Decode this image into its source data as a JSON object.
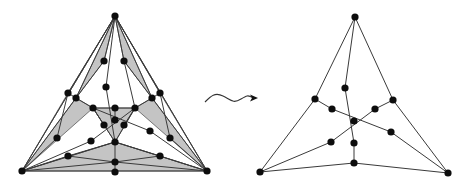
{
  "diagram": {
    "type": "graph-transformation",
    "colors": {
      "face_fill": "#c4c4c4",
      "edge": "#3a3a3a",
      "vertex": "#0d0d0d",
      "background": "#ffffff"
    },
    "left_graph": {
      "vertices": [
        [
          115,
          16
        ],
        [
          22,
          171
        ],
        [
          207,
          171
        ],
        [
          104,
          61
        ],
        [
          124,
          61
        ],
        [
          68,
          93
        ],
        [
          76,
          98
        ],
        [
          160,
          93
        ],
        [
          152,
          98
        ],
        [
          106,
          87
        ],
        [
          93,
          108
        ],
        [
          115,
          108
        ],
        [
          135,
          108
        ],
        [
          115,
          120
        ],
        [
          104,
          125
        ],
        [
          124,
          125
        ],
        [
          57,
          138
        ],
        [
          170,
          138
        ],
        [
          91,
          141
        ],
        [
          150,
          131
        ],
        [
          115,
          142
        ],
        [
          68,
          156
        ],
        [
          160,
          156
        ],
        [
          115,
          162
        ],
        [
          115,
          172
        ]
      ],
      "faces": [
        [
          [
            115,
            16
          ],
          [
            22,
            171
          ],
          [
            68,
            93
          ]
        ],
        [
          [
            115,
            16
          ],
          [
            76,
            98
          ],
          [
            104,
            61
          ]
        ],
        [
          [
            76,
            98
          ],
          [
            22,
            171
          ],
          [
            93,
            108
          ]
        ],
        [
          [
            115,
            16
          ],
          [
            207,
            171
          ],
          [
            160,
            93
          ]
        ],
        [
          [
            115,
            16
          ],
          [
            152,
            98
          ],
          [
            124,
            61
          ]
        ],
        [
          [
            152,
            98
          ],
          [
            207,
            171
          ],
          [
            135,
            108
          ]
        ],
        [
          [
            93,
            108
          ],
          [
            135,
            108
          ],
          [
            115,
            142
          ]
        ],
        [
          [
            22,
            171
          ],
          [
            207,
            171
          ],
          [
            115,
            142
          ]
        ]
      ],
      "edges": [
        [
          [
            115,
            16
          ],
          [
            22,
            171
          ]
        ],
        [
          [
            115,
            16
          ],
          [
            207,
            171
          ]
        ],
        [
          [
            22,
            171
          ],
          [
            207,
            171
          ]
        ],
        [
          [
            115,
            16
          ],
          [
            68,
            93
          ]
        ],
        [
          [
            115,
            16
          ],
          [
            76,
            98
          ]
        ],
        [
          [
            115,
            16
          ],
          [
            104,
            61
          ]
        ],
        [
          [
            115,
            16
          ],
          [
            160,
            93
          ]
        ],
        [
          [
            115,
            16
          ],
          [
            152,
            98
          ]
        ],
        [
          [
            115,
            16
          ],
          [
            124,
            61
          ]
        ],
        [
          [
            115,
            16
          ],
          [
            106,
            87
          ]
        ],
        [
          [
            106,
            87
          ],
          [
            115,
            142
          ]
        ],
        [
          [
            104,
            61
          ],
          [
            76,
            98
          ]
        ],
        [
          [
            124,
            61
          ],
          [
            152,
            98
          ]
        ],
        [
          [
            68,
            93
          ],
          [
            76,
            98
          ]
        ],
        [
          [
            160,
            93
          ],
          [
            152,
            98
          ]
        ],
        [
          [
            68,
            93
          ],
          [
            57,
            138
          ]
        ],
        [
          [
            57,
            138
          ],
          [
            22,
            171
          ]
        ],
        [
          [
            160,
            93
          ],
          [
            170,
            138
          ]
        ],
        [
          [
            170,
            138
          ],
          [
            207,
            171
          ]
        ],
        [
          [
            76,
            98
          ],
          [
            93,
            108
          ]
        ],
        [
          [
            76,
            98
          ],
          [
            22,
            171
          ]
        ],
        [
          [
            152,
            98
          ],
          [
            135,
            108
          ]
        ],
        [
          [
            152,
            98
          ],
          [
            207,
            171
          ]
        ],
        [
          [
            124,
            61
          ],
          [
            135,
            108
          ]
        ],
        [
          [
            93,
            108
          ],
          [
            115,
            108
          ]
        ],
        [
          [
            115,
            108
          ],
          [
            135,
            108
          ]
        ],
        [
          [
            93,
            108
          ],
          [
            115,
            142
          ]
        ],
        [
          [
            135,
            108
          ],
          [
            115,
            142
          ]
        ],
        [
          [
            115,
            108
          ],
          [
            115,
            120
          ]
        ],
        [
          [
            93,
            108
          ],
          [
            104,
            125
          ]
        ],
        [
          [
            135,
            108
          ],
          [
            124,
            125
          ]
        ],
        [
          [
            93,
            108
          ],
          [
            150,
            131
          ]
        ],
        [
          [
            150,
            131
          ],
          [
            207,
            171
          ]
        ],
        [
          [
            135,
            108
          ],
          [
            91,
            141
          ]
        ],
        [
          [
            91,
            141
          ],
          [
            22,
            171
          ]
        ],
        [
          [
            115,
            142
          ],
          [
            22,
            171
          ]
        ],
        [
          [
            115,
            142
          ],
          [
            207,
            171
          ]
        ],
        [
          [
            115,
            142
          ],
          [
            115,
            162
          ]
        ],
        [
          [
            115,
            162
          ],
          [
            115,
            172
          ]
        ],
        [
          [
            22,
            171
          ],
          [
            68,
            156
          ]
        ],
        [
          [
            68,
            156
          ],
          [
            115,
            142
          ]
        ],
        [
          [
            68,
            156
          ],
          [
            115,
            162
          ]
        ],
        [
          [
            207,
            171
          ],
          [
            160,
            156
          ]
        ],
        [
          [
            160,
            156
          ],
          [
            115,
            142
          ]
        ],
        [
          [
            160,
            156
          ],
          [
            115,
            162
          ]
        ],
        [
          [
            22,
            171
          ],
          [
            115,
            162
          ]
        ],
        [
          [
            207,
            171
          ],
          [
            115,
            162
          ]
        ]
      ]
    },
    "arrow": {
      "label": "",
      "style": "wavy",
      "from": [
        205,
        102
      ],
      "to": [
        258,
        98
      ]
    },
    "right_graph": {
      "vertices": [
        [
          355,
          17
        ],
        [
          260,
          172
        ],
        [
          448,
          173
        ],
        [
          345,
          88
        ],
        [
          315,
          99
        ],
        [
          393,
          100
        ],
        [
          332,
          109
        ],
        [
          375,
          109
        ],
        [
          354,
          121
        ],
        [
          391,
          132
        ],
        [
          331,
          142
        ],
        [
          354,
          143
        ],
        [
          354,
          163
        ]
      ],
      "edges": [
        [
          [
            355,
            17
          ],
          [
            315,
            99
          ]
        ],
        [
          [
            315,
            99
          ],
          [
            260,
            172
          ]
        ],
        [
          [
            355,
            17
          ],
          [
            393,
            100
          ]
        ],
        [
          [
            393,
            100
          ],
          [
            448,
            173
          ]
        ],
        [
          [
            355,
            17
          ],
          [
            345,
            88
          ]
        ],
        [
          [
            345,
            88
          ],
          [
            354,
            143
          ]
        ],
        [
          [
            260,
            172
          ],
          [
            354,
            163
          ]
        ],
        [
          [
            354,
            163
          ],
          [
            448,
            173
          ]
        ],
        [
          [
            354,
            143
          ],
          [
            354,
            163
          ]
        ],
        [
          [
            315,
            99
          ],
          [
            332,
            109
          ]
        ],
        [
          [
            332,
            109
          ],
          [
            391,
            132
          ]
        ],
        [
          [
            391,
            132
          ],
          [
            448,
            173
          ]
        ],
        [
          [
            393,
            100
          ],
          [
            375,
            109
          ]
        ],
        [
          [
            375,
            109
          ],
          [
            331,
            142
          ]
        ],
        [
          [
            331,
            142
          ],
          [
            260,
            172
          ]
        ]
      ]
    }
  }
}
